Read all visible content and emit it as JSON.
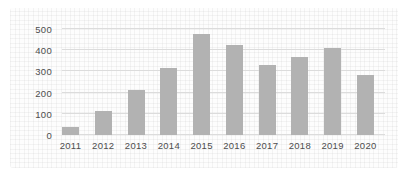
{
  "chart_data": {
    "type": "bar",
    "categories": [
      "2011",
      "2012",
      "2013",
      "2014",
      "2015",
      "2016",
      "2017",
      "2018",
      "2019",
      "2020"
    ],
    "values": [
      40,
      115,
      210,
      315,
      475,
      425,
      330,
      370,
      410,
      285
    ],
    "title": "",
    "xlabel": "",
    "ylabel": "",
    "ylim": [
      0,
      500
    ],
    "yticks": [
      0,
      100,
      200,
      300,
      400,
      500
    ],
    "grid": true,
    "legend": "none",
    "colors": {
      "bar": "#b2b2b2",
      "gridline": "#dcdcdc",
      "tick_text": "#4d4d4d",
      "background": "#fdfdfd"
    }
  }
}
